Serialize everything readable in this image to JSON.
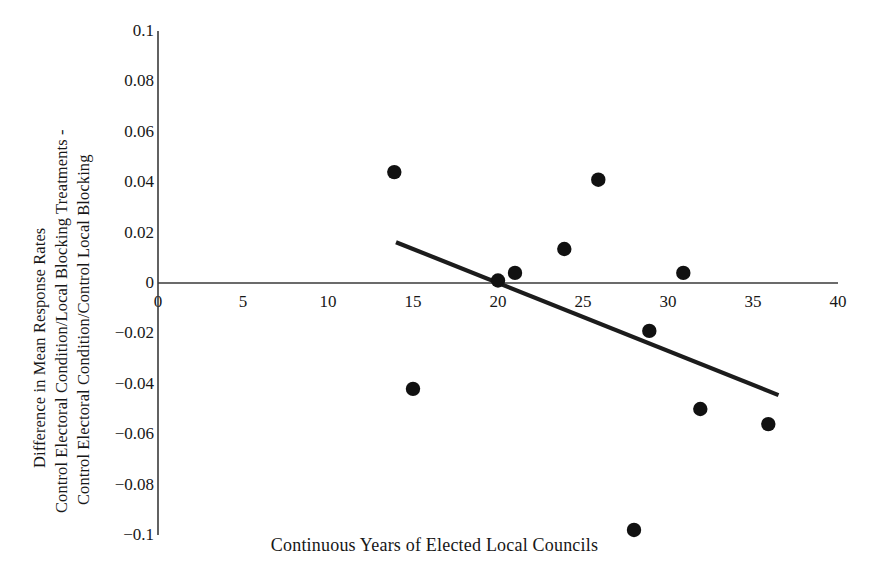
{
  "chart_data": {
    "type": "scatter",
    "title": "",
    "xlabel": "Continuous Years of Elected Local  Councils",
    "ylabel_lines": [
      "Difference in Mean Response Rates",
      "Control Electoral Condition/Local Blocking Treatments -",
      "Control Electoral Condition/Control Local Blocking"
    ],
    "xlim": [
      0,
      40
    ],
    "ylim": [
      -0.1,
      0.1
    ],
    "xticks": [
      0,
      5,
      10,
      15,
      20,
      25,
      30,
      35,
      40
    ],
    "xtick_labels": [
      "0",
      "5",
      "10",
      "15",
      "20",
      "25",
      "30",
      "35",
      "40"
    ],
    "yticks": [
      0.1,
      0.08,
      0.06,
      0.04,
      0.02,
      0,
      -0.02,
      -0.04,
      -0.06,
      -0.08,
      -0.1
    ],
    "ytick_labels": [
      "0.1",
      "0.08",
      "0.06",
      "0.04",
      "0.02",
      "0",
      "-0.02",
      "-0.04",
      "-0.06",
      "-0.08",
      "-0.1"
    ],
    "grid": false,
    "legend": null,
    "points": [
      {
        "x": 13.9,
        "y": 0.044
      },
      {
        "x": 15.0,
        "y": -0.042
      },
      {
        "x": 20.0,
        "y": 0.001
      },
      {
        "x": 21.0,
        "y": 0.004
      },
      {
        "x": 23.9,
        "y": 0.0135
      },
      {
        "x": 25.9,
        "y": 0.041
      },
      {
        "x": 28.0,
        "y": -0.098
      },
      {
        "x": 28.9,
        "y": -0.019
      },
      {
        "x": 30.9,
        "y": 0.004
      },
      {
        "x": 31.9,
        "y": -0.05
      },
      {
        "x": 35.9,
        "y": -0.056
      }
    ],
    "trendline": {
      "x0": 14.0,
      "y0": 0.0162,
      "x1": 36.5,
      "y1": -0.0445
    },
    "zero_line": {
      "y": 0,
      "x0": 0,
      "x1": 40
    },
    "marker_color": "#111111",
    "trendline_color": "#1c1c1c",
    "axis_color": "#3a3a3a",
    "background": "#ffffff"
  }
}
